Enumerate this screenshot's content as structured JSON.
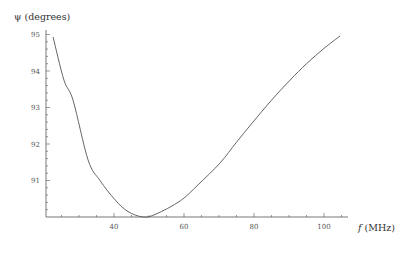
{
  "chart_data": {
    "type": "line",
    "title": "",
    "xlabel": "f (MHz)",
    "xlabel_var": "f",
    "xlabel_unit": " (MHz)",
    "ylabel": "ψ (degrees)",
    "xlim": [
      20.6,
      107
    ],
    "ylim": [
      90,
      95.1
    ],
    "xticks": [
      40,
      60,
      80,
      100
    ],
    "yticks": [
      91,
      92,
      93,
      94,
      95
    ],
    "x_minor_step": 5,
    "y_minor_step": 0.2,
    "grid": false,
    "legend": null,
    "series": [
      {
        "name": "psi",
        "color": "#555555",
        "x": [
          22.6,
          25.7,
          28.3,
          32.6,
          36.0,
          40.3,
          44.0,
          48.3,
          52.0,
          58.9,
          64.0,
          70.3,
          75.0,
          79.7,
          85.0,
          90.3,
          95.0,
          100.0,
          104.6
        ],
        "y": [
          94.93,
          93.75,
          93.2,
          91.56,
          91.0,
          90.47,
          90.15,
          90.0,
          90.08,
          90.44,
          90.88,
          91.48,
          92.05,
          92.6,
          93.2,
          93.75,
          94.2,
          94.62,
          94.96
        ]
      }
    ]
  },
  "labels": {
    "ylabel": "ψ (degrees)",
    "xlabel_var": "f",
    "xlabel_unit": " (MHz)",
    "xticks": [
      "40",
      "60",
      "80",
      "100"
    ],
    "yticks": [
      "91",
      "92",
      "93",
      "94",
      "95"
    ]
  }
}
